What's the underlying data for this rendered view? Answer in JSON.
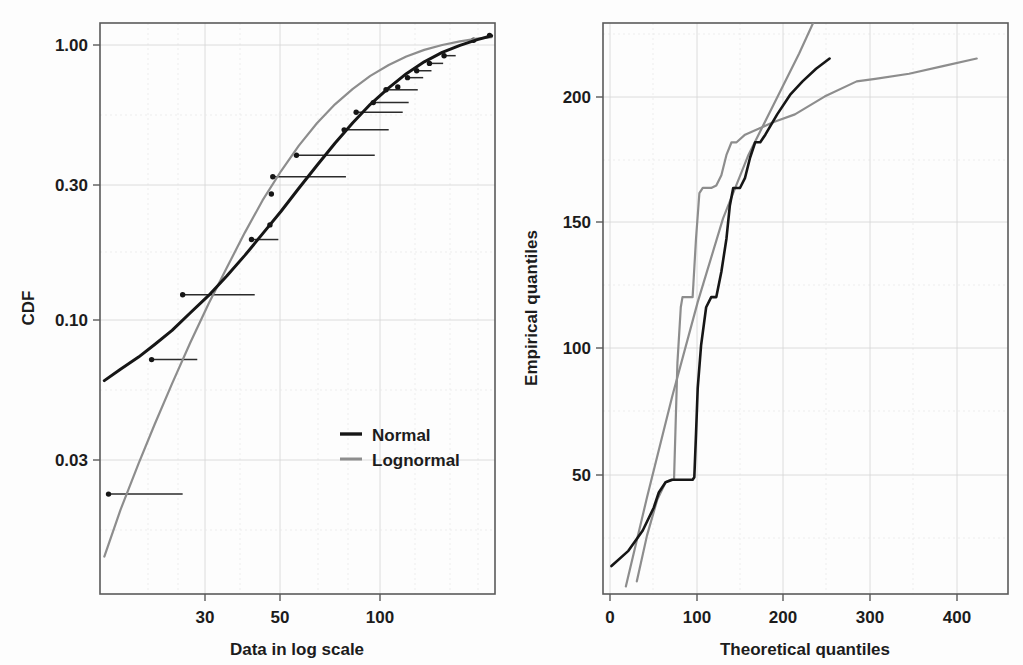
{
  "figure": {
    "background": "#fdfdfd",
    "panel_count": 2
  },
  "colors": {
    "normal": "#161616",
    "lognormal": "#8d8d8d",
    "empirical": "#161616",
    "grid": "#d8d8d8",
    "frame": "#5a5a5a",
    "text": "#1c1c1c"
  },
  "chart_data": [
    {
      "id": "cdf-log-plot",
      "type": "line",
      "title": "",
      "xlabel": "Data in log scale",
      "ylabel": "CDF",
      "xscale": "log",
      "yscale": "log",
      "xlim": [
        17.5,
        230
      ],
      "ylim": [
        0.0115,
        1.09
      ],
      "grid": true,
      "legend_position": "bottom-right",
      "xticks": [
        30,
        50,
        100
      ],
      "xticklabels": [
        "30",
        "50",
        "100"
      ],
      "yticks": [
        1.0,
        0.3,
        0.1,
        0.03
      ],
      "yticklabels": [
        "1.00",
        "0.30",
        "0.10",
        "0.03"
      ],
      "series": [
        {
          "name": "Normal",
          "color": "#161616",
          "x": [
            18.0,
            20.0,
            22.5,
            25.0,
            28.0,
            31.5,
            35.5,
            40.0,
            45.0,
            50.5,
            57.0,
            64.0,
            72.0,
            81.0,
            91.0,
            102.0,
            115.0,
            129.0,
            145.0,
            163.0,
            183.0,
            205.0,
            225.0
          ],
          "y": [
            0.063,
            0.069,
            0.076,
            0.084,
            0.094,
            0.108,
            0.124,
            0.145,
            0.171,
            0.203,
            0.243,
            0.292,
            0.35,
            0.418,
            0.492,
            0.57,
            0.65,
            0.728,
            0.8,
            0.862,
            0.912,
            0.955,
            0.985
          ]
        },
        {
          "name": "Lognormal",
          "color": "#8d8d8d",
          "x": [
            18.0,
            20.0,
            22.5,
            25.0,
            28.0,
            31.5,
            35.5,
            40.0,
            45.0,
            50.5,
            57.0,
            64.0,
            72.0,
            81.0,
            91.0,
            102.0,
            115.0,
            129.0,
            145.0,
            163.0,
            183.0,
            205.0,
            225.0
          ],
          "y": [
            0.0155,
            0.0225,
            0.0325,
            0.0445,
            0.0615,
            0.085,
            0.116,
            0.155,
            0.205,
            0.265,
            0.335,
            0.41,
            0.49,
            0.57,
            0.645,
            0.715,
            0.78,
            0.835,
            0.88,
            0.915,
            0.942,
            0.962,
            0.974
          ]
        }
      ],
      "ecdf_points": {
        "name": "Empirical CDF steps",
        "description": "Filled dots with horizontal step segments extending to the right",
        "x": [
          18.5,
          24.5,
          30.0,
          47.0,
          53.0,
          53.5,
          54.0,
          63.0,
          86.0,
          93.0,
          104.0,
          113.0,
          122.0,
          130.0,
          138.0,
          150.0,
          165.0,
          200.0,
          222.0
        ],
        "y": [
          0.0255,
          0.0745,
          0.125,
          0.194,
          0.218,
          0.279,
          0.32,
          0.38,
          0.465,
          0.535,
          0.578,
          0.64,
          0.655,
          0.705,
          0.745,
          0.79,
          0.84,
          0.95,
          0.988
        ],
        "x_end": [
          30.0,
          33.0,
          48.0,
          56.0,
          null,
          null,
          87.0,
          105.0,
          115.0,
          126.0,
          131.0,
          139.0,
          null,
          144.0,
          152.0,
          164.0,
          178.0,
          null,
          null
        ]
      }
    },
    {
      "id": "qq-plot",
      "type": "line",
      "title": "",
      "xlabel": "Theoretical quantiles",
      "ylabel": "Empirical quantiles",
      "xscale": "linear",
      "yscale": "linear",
      "xlim": [
        -22,
        457
      ],
      "ylim": [
        7,
        232
      ],
      "grid": true,
      "xticks": [
        0,
        100,
        200,
        300,
        400
      ],
      "xticklabels": [
        "0",
        "100",
        "200",
        "300",
        "400"
      ],
      "yticks": [
        50,
        100,
        150,
        200
      ],
      "yticklabels": [
        "50",
        "100",
        "150",
        "200"
      ],
      "series": [
        {
          "name": "Empirical vs Normal quantiles",
          "color": "#161616",
          "x": [
            -12,
            8,
            25,
            38,
            44,
            52,
            60,
            68,
            76,
            84,
            86,
            88,
            90,
            94,
            100,
            106,
            112,
            118,
            124,
            128,
            132,
            140,
            146,
            152,
            158,
            164,
            170,
            184,
            200,
            214,
            230,
            246
          ],
          "y": [
            18,
            24,
            32,
            41,
            47,
            51,
            52,
            52,
            52,
            52,
            53,
            70,
            88,
            105,
            120,
            124,
            124,
            134,
            147,
            160,
            167,
            167,
            171,
            179,
            185,
            185,
            188,
            196,
            204,
            209,
            214,
            218
          ]
        },
        {
          "name": "Empirical vs Lognormal quantiles (reference line)",
          "color": "#8d8d8d",
          "x": [
            5,
            30,
            60,
            90,
            120,
            150,
            180,
            210,
            232
          ],
          "y": [
            10,
            45,
            85,
            122,
            155,
            180,
            200,
            220,
            236
          ]
        },
        {
          "name": "Empirical vs Lognormal quantiles",
          "color": "#8d8d8d",
          "x": [
            18,
            30,
            42,
            52,
            58,
            62,
            66,
            70,
            72,
            74,
            78,
            84,
            88,
            92,
            96,
            100,
            106,
            112,
            118,
            124,
            130,
            136,
            146,
            160,
            180,
            205,
            240,
            278,
            300,
            340,
            380,
            420
          ],
          "y": [
            12,
            30,
            44,
            51,
            52,
            52,
            98,
            120,
            124,
            124,
            124,
            124,
            147,
            165,
            167,
            167,
            167,
            168,
            172,
            180,
            185,
            185,
            188,
            190,
            193,
            196,
            203,
            209,
            210,
            212,
            215,
            218
          ]
        }
      ]
    }
  ],
  "left_panel": {
    "ylabel": "CDF",
    "xlabel": "Data in log scale",
    "yticklabels": [
      "1.00",
      "0.30",
      "0.10",
      "0.03"
    ],
    "xticklabels": [
      "30",
      "50",
      "100"
    ],
    "legend": {
      "items": [
        {
          "label": "Normal",
          "color": "#161616"
        },
        {
          "label": "Lognormal",
          "color": "#8d8d8d"
        }
      ]
    }
  },
  "right_panel": {
    "ylabel": "Empirical quantiles",
    "xlabel": "Theoretical quantiles",
    "yticklabels": [
      "200",
      "150",
      "100",
      "50"
    ],
    "xticklabels": [
      "0",
      "100",
      "200",
      "300",
      "400"
    ]
  }
}
